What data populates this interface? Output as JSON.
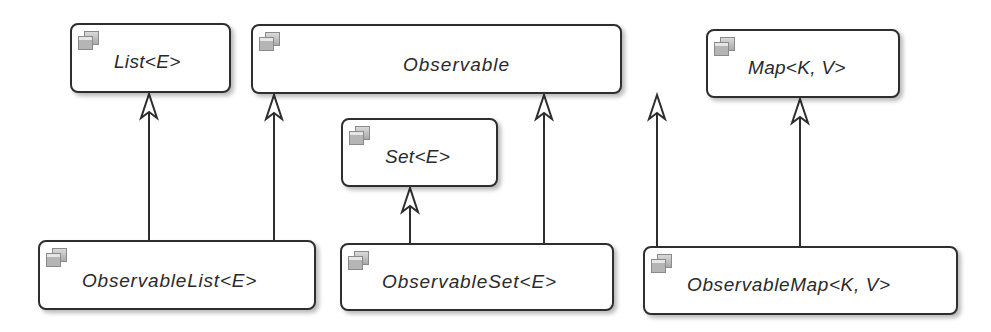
{
  "diagram": {
    "type": "uml-class-diagram",
    "nodes": {
      "list": {
        "label": "List<E>",
        "icon": "interface-icon"
      },
      "observable": {
        "label": "Observable",
        "icon": "interface-icon"
      },
      "map": {
        "label": "Map<K, V>",
        "icon": "interface-icon"
      },
      "set": {
        "label": "Set<E>",
        "icon": "interface-icon"
      },
      "observable_list": {
        "label": "ObservableList<E>",
        "icon": "interface-icon"
      },
      "observable_set": {
        "label": "ObservableSet<E>",
        "icon": "interface-icon"
      },
      "observable_map": {
        "label": "ObservableMap<K, V>",
        "icon": "interface-icon"
      }
    },
    "edges": [
      {
        "from": "ObservableList<E>",
        "to": "List<E>",
        "kind": "generalization"
      },
      {
        "from": "ObservableList<E>",
        "to": "Observable",
        "kind": "generalization"
      },
      {
        "from": "ObservableSet<E>",
        "to": "Set<E>",
        "kind": "generalization"
      },
      {
        "from": "ObservableSet<E>",
        "to": "Observable",
        "kind": "generalization"
      },
      {
        "from": "ObservableMap<K, V>",
        "to": "Observable",
        "kind": "generalization"
      },
      {
        "from": "ObservableMap<K, V>",
        "to": "Map<K, V>",
        "kind": "generalization"
      }
    ],
    "colors": {
      "stroke": "#2e2e2e",
      "text": "#2a2a2a",
      "fill": "#ffffff",
      "icon": "#b5b5b5"
    }
  }
}
